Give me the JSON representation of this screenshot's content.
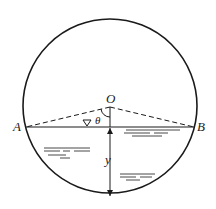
{
  "diagram": {
    "labels": {
      "center": "O",
      "left_point": "A",
      "right_point": "B",
      "angle": "θ",
      "depth": "y",
      "free_surface_symbol": "∇"
    },
    "colors": {
      "stroke": "#1a1a1a",
      "background": "#ffffff"
    }
  }
}
